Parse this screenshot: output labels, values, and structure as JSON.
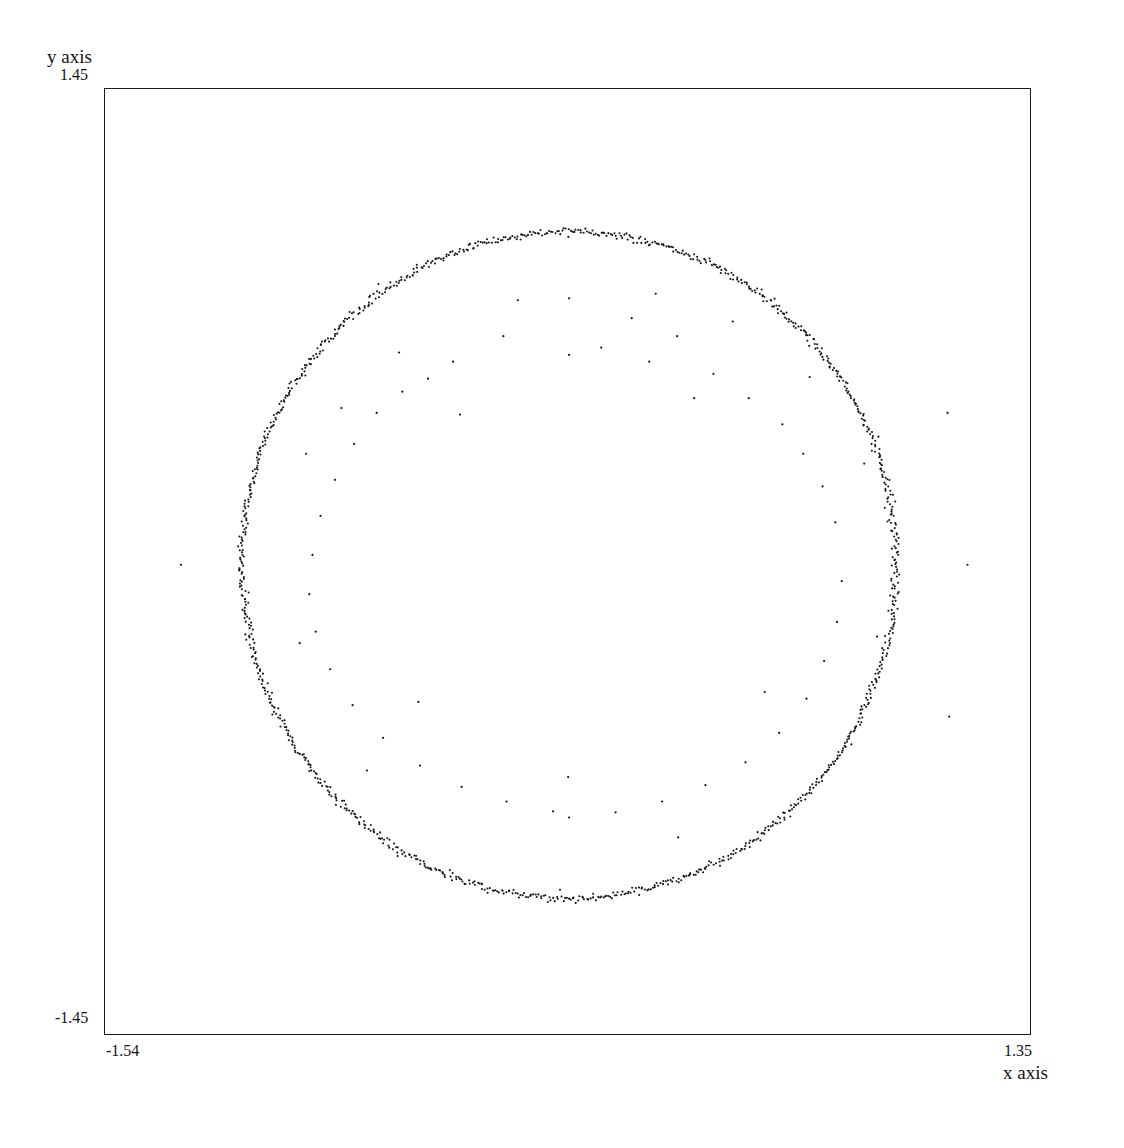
{
  "figure": {
    "title": "",
    "background": "#ffffff",
    "ink_color": "#141414"
  },
  "axes": {
    "x_label": "x axis",
    "y_label": "y axis",
    "x_min_label": "-1.54",
    "x_max_label": "1.35",
    "y_min_label": "-1.45",
    "y_max_label": "1.45"
  },
  "chart_data": {
    "type": "scatter",
    "title": "",
    "xlabel": "x axis",
    "ylabel": "y axis",
    "xlim": [
      -1.54,
      1.35
    ],
    "ylim": [
      -1.45,
      1.45
    ],
    "grid": false,
    "legend": null,
    "xticks": [
      -1.54,
      1.35
    ],
    "xticklabels": [
      "-1.54",
      "1.35"
    ],
    "yticks": [
      -1.45,
      1.45
    ],
    "yticklabels": [
      "-1.45",
      "1.45"
    ],
    "marker": {
      "shape": "dot",
      "size_px": 2.1,
      "color": "#141414"
    },
    "series": [
      {
        "name": "ring",
        "model": "circle",
        "center": [
          -0.09,
          -0.01
        ],
        "radius": 1.02,
        "radial_noise_sigma": 0.006,
        "n_points": 1150
      },
      {
        "name": "outliers",
        "model": "scatter",
        "n_points": 62,
        "points": [
          [
            -0.09,
            0.806
          ],
          [
            0.105,
            0.745
          ],
          [
            -0.295,
            0.69
          ],
          [
            0.247,
            0.69
          ],
          [
            -0.452,
            0.612
          ],
          [
            0.01,
            0.655
          ],
          [
            0.16,
            0.612
          ],
          [
            -0.61,
            0.52
          ],
          [
            -0.53,
            0.56
          ],
          [
            0.36,
            0.575
          ],
          [
            0.47,
            0.5
          ],
          [
            -0.69,
            0.455
          ],
          [
            0.575,
            0.42
          ],
          [
            -0.76,
            0.36
          ],
          [
            0.64,
            0.33
          ],
          [
            -0.82,
            0.25
          ],
          [
            0.7,
            0.23
          ],
          [
            -0.865,
            0.14
          ],
          [
            0.74,
            0.12
          ],
          [
            -0.89,
            0.02
          ],
          [
            -0.9,
            -0.1
          ],
          [
            0.76,
            -0.06
          ],
          [
            -0.88,
            -0.215
          ],
          [
            0.745,
            -0.185
          ],
          [
            -0.835,
            -0.33
          ],
          [
            0.705,
            -0.305
          ],
          [
            -0.765,
            -0.44
          ],
          [
            0.65,
            -0.42
          ],
          [
            -0.67,
            -0.54
          ],
          [
            0.565,
            -0.525
          ],
          [
            -0.555,
            -0.625
          ],
          [
            0.46,
            -0.615
          ],
          [
            -0.425,
            -0.69
          ],
          [
            0.335,
            -0.685
          ],
          [
            -0.285,
            -0.735
          ],
          [
            0.2,
            -0.735
          ],
          [
            -0.14,
            -0.765
          ],
          [
            0.055,
            -0.768
          ],
          [
            -0.09,
            -0.784
          ],
          [
            1.09,
            0.455
          ],
          [
            1.152,
            -0.01
          ],
          [
            1.095,
            -0.475
          ],
          [
            -1.3,
            -0.01
          ],
          [
            -0.09,
            0.633
          ],
          [
            -0.093,
            -0.66
          ],
          [
            0.3,
            0.5
          ],
          [
            -0.43,
            0.45
          ],
          [
            0.52,
            -0.4
          ],
          [
            -0.56,
            -0.43
          ],
          [
            0.18,
            0.82
          ],
          [
            -0.25,
            0.8
          ],
          [
            0.42,
            0.735
          ],
          [
            -0.62,
            0.64
          ],
          [
            0.66,
            0.565
          ],
          [
            -0.8,
            0.47
          ],
          [
            0.83,
            0.3
          ],
          [
            -0.91,
            0.33
          ],
          [
            0.87,
            -0.23
          ],
          [
            -0.93,
            -0.25
          ],
          [
            0.79,
            -0.56
          ],
          [
            -0.72,
            -0.64
          ],
          [
            0.25,
            -0.845
          ]
        ]
      }
    ]
  }
}
